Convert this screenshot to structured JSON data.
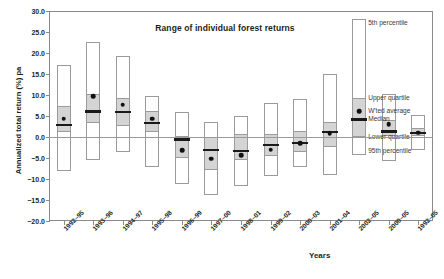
{
  "chart_data": {
    "type": "box",
    "title": "Range of individual forest returns",
    "xlabel": "Years",
    "ylabel": "Annualized total return (%) pa",
    "ylim": [
      -20.0,
      30.0
    ],
    "ytick_labels": [
      "30.0",
      "25.0",
      "20.0",
      "15.0",
      "10.0",
      "5.0",
      "0.0",
      "-5.0",
      "-10.0",
      "-15.0",
      "-20.0"
    ],
    "ytick_values": [
      30.0,
      25.0,
      20.0,
      15.0,
      10.0,
      5.0,
      0.0,
      -5.0,
      -10.0,
      -15.0,
      -20.0
    ],
    "grid": false,
    "legend_position": "inline-annotations",
    "categories": [
      "1992-95",
      "1993-96",
      "1994-97",
      "1995-98",
      "1996-99",
      "1997-00",
      "1998-01",
      "1999-02",
      "2000-03",
      "2001-04",
      "2002-05",
      "2000-05",
      "1992-05"
    ],
    "series": [
      {
        "name": "1992-95",
        "p5": 17.2,
        "upper_quartile": 7.4,
        "median": 2.9,
        "weighted_average": 4.4,
        "lower_quartile": 1.1,
        "p95": -8.0
      },
      {
        "name": "1993-96",
        "p5": 22.6,
        "upper_quartile": 10.2,
        "median": 6.1,
        "weighted_average": 9.7,
        "lower_quartile": 3.3,
        "p95": -5.5
      },
      {
        "name": "1994-97",
        "p5": 19.2,
        "upper_quartile": 9.4,
        "median": 6.0,
        "weighted_average": 7.7,
        "lower_quartile": 2.5,
        "p95": -3.5
      },
      {
        "name": "1995-98",
        "p5": 9.8,
        "upper_quartile": 6.1,
        "median": 3.4,
        "weighted_average": 4.4,
        "lower_quartile": 1.2,
        "p95": -7.2
      },
      {
        "name": "1996-99",
        "p5": 6.0,
        "upper_quartile": 0.2,
        "median": -0.6,
        "weighted_average": -3.1,
        "lower_quartile": -5.1,
        "p95": -11.3
      },
      {
        "name": "1997-00",
        "p5": 3.6,
        "upper_quartile": -0.1,
        "median": -3.1,
        "weighted_average": -5.2,
        "lower_quartile": -7.9,
        "p95": -13.9
      },
      {
        "name": "1998-01",
        "p5": 4.9,
        "upper_quartile": 0.7,
        "median": -3.3,
        "weighted_average": -4.4,
        "lower_quartile": -5.4,
        "p95": -11.6
      },
      {
        "name": "1999-02",
        "p5": 8.0,
        "upper_quartile": 0.7,
        "median": -1.9,
        "weighted_average": -3.0,
        "lower_quartile": -4.6,
        "p95": -9.3
      },
      {
        "name": "2000-03",
        "p5": 9.1,
        "upper_quartile": 1.4,
        "median": -1.4,
        "weighted_average": -1.5,
        "lower_quartile": -3.5,
        "p95": -7.2
      },
      {
        "name": "2001-04",
        "p5": 15.1,
        "upper_quartile": 3.6,
        "median": 1.2,
        "weighted_average": 0.9,
        "lower_quartile": -2.3,
        "p95": -9.0
      },
      {
        "name": "2002-05",
        "p5": 28.0,
        "upper_quartile": 9.2,
        "median": 4.2,
        "weighted_average": 6.1,
        "lower_quartile": 0.0,
        "p95": -4.2
      },
      {
        "name": "2000-05",
        "p5": 10.2,
        "upper_quartile": 4.1,
        "median": 1.3,
        "weighted_average": 3.0,
        "lower_quartile": 0.3,
        "p95": -5.7
      },
      {
        "name": "1992-05",
        "p5": 5.3,
        "upper_quartile": 2.1,
        "median": 1.0,
        "weighted_average": 1.0,
        "lower_quartile": 0.2,
        "p95": -3.2
      }
    ],
    "annotations": [
      {
        "key": "p5",
        "text": "5th percentile"
      },
      {
        "key": "upper_quartile",
        "text": "Upper quartile"
      },
      {
        "key": "weighted_average",
        "text": "W'ted average"
      },
      {
        "key": "median",
        "text": "Median"
      },
      {
        "key": "lower_quartile",
        "text": "Lower quartile"
      },
      {
        "key": "p95",
        "text": "95th percentile"
      }
    ],
    "colors": {
      "box_fill": "#d4d4d4",
      "whisker_fill": "#ffffff",
      "outline": "#9b9b9b",
      "median": "#1a1a1a",
      "mean": "#111111",
      "axis": "#8a8a8a",
      "text": "#231f20"
    }
  }
}
